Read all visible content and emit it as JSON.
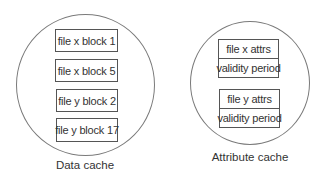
{
  "data_cache": {
    "label": "Data cache",
    "blocks": [
      {
        "text": "file x block 1"
      },
      {
        "text": "file x block 5"
      },
      {
        "text": "file y block 2"
      },
      {
        "text": "file y block 17"
      }
    ]
  },
  "attribute_cache": {
    "label": "Attribute cache",
    "entries": [
      {
        "attrs": "file x attrs",
        "validity": "validity period"
      },
      {
        "attrs": "file y attrs",
        "validity": "validity period"
      }
    ]
  },
  "colors": {
    "circle_stroke": "#7a7a7a",
    "box_stroke": "#555555",
    "text": "#333333",
    "background": "#ffffff"
  }
}
